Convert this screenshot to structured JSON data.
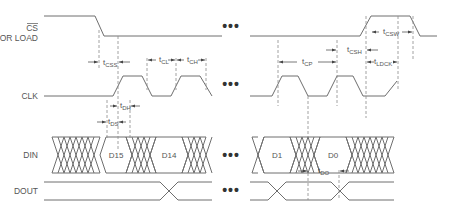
{
  "signals": {
    "cs": {
      "line1": "CS",
      "line2": "OR LOAD"
    },
    "clk": {
      "label": "CLK"
    },
    "din": {
      "label": "DIN"
    },
    "dout": {
      "label": "DOUT"
    }
  },
  "data_bits": {
    "d15": "D15",
    "d14": "D14",
    "d1": "D1",
    "d0": "D0"
  },
  "timing": {
    "tcss": {
      "t": "t",
      "sub": "CSS"
    },
    "tcl": {
      "t": "t",
      "sub": "CL"
    },
    "tch": {
      "t": "t",
      "sub": "CH"
    },
    "tdh": {
      "t": "t",
      "sub": "DH"
    },
    "tds": {
      "t": "t",
      "sub": "DS"
    },
    "tcp": {
      "t": "t",
      "sub": "CP"
    },
    "tcsh": {
      "t": "t",
      "sub": "CSH"
    },
    "tcsw": {
      "t": "t",
      "sub": "CSW"
    },
    "tldck": {
      "t": "t",
      "sub": "LDCK"
    },
    "tdo": {
      "t": "t",
      "sub": "DO"
    }
  },
  "ellipsis": "•••"
}
